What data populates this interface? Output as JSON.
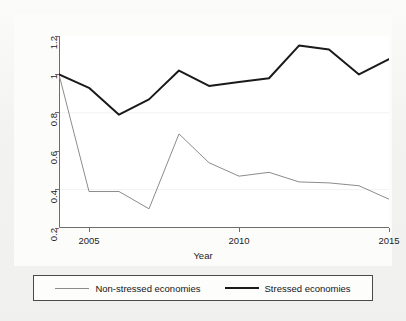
{
  "chart_data": {
    "type": "line",
    "title": "",
    "xlabel": "Year",
    "ylabel": "",
    "xlim": [
      2004,
      2015
    ],
    "ylim": [
      0.2,
      1.2
    ],
    "grid": false,
    "legend_position": "bottom",
    "x": [
      2004,
      2005,
      2006,
      2007,
      2008,
      2009,
      2010,
      2011,
      2012,
      2013,
      2014,
      2015
    ],
    "xticks": [
      2005,
      2010,
      2015
    ],
    "xticklabels": [
      "2005",
      "2010",
      "2015"
    ],
    "yticks": [
      0.2,
      0.4,
      0.6,
      0.8,
      1,
      1.2
    ],
    "yticklabels": [
      "0.2",
      "0.4",
      "0.6",
      "0.8",
      "1",
      "1.2"
    ],
    "series": [
      {
        "name": "Non-stressed economies",
        "color": "#8c8c8c",
        "width": 1,
        "values": [
          1.0,
          0.39,
          0.39,
          0.3,
          0.69,
          0.54,
          0.47,
          0.49,
          0.44,
          0.435,
          0.42,
          0.35
        ]
      },
      {
        "name": "Stressed economies",
        "color": "#1a1a1a",
        "width": 2,
        "values": [
          1.0,
          0.93,
          0.79,
          0.87,
          1.02,
          0.94,
          0.96,
          0.98,
          1.15,
          1.13,
          1.0,
          1.08
        ]
      }
    ]
  },
  "legend": {
    "entries": [
      {
        "label": "Non-stressed economies"
      },
      {
        "label": "Stressed economies"
      }
    ]
  },
  "axes": {
    "x_title": "Year"
  }
}
